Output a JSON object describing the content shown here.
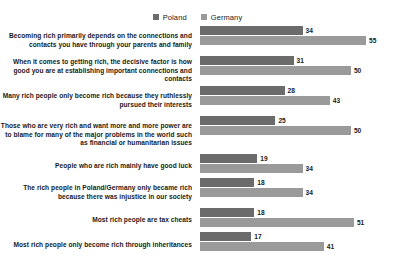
{
  "legend": {
    "items": [
      {
        "label": "Poland",
        "color": "#6b6b6b",
        "icon": "square-swatch-icon"
      },
      {
        "label": "Germany",
        "color": "#9a9a9a",
        "icon": "square-swatch-icon"
      }
    ]
  },
  "chart_data": {
    "type": "bar",
    "orientation": "horizontal",
    "title": "",
    "subtitle": "",
    "xlabel": "",
    "ylabel": "",
    "xlim": [
      0,
      55
    ],
    "grid": false,
    "legend_position": "top-center",
    "value_labels": true,
    "categories": [
      "Becoming rich primarily depends on the connections and contacts you have through your parents and family",
      "When it comes to getting rich, the decisive factor is how good you are at establishing important connections and contacts",
      "Many rich people only become rich because they ruthlessly pursued their interests",
      "Those who are very rich and want more and more power are to blame for many of the major problems in the world such as financial or humanitarian issues",
      "People who are rich mainly have good luck",
      "The rich people in Poland/Germany only became rich because there was injustice in our society",
      "Most rich people are tax cheats",
      "Most rich people only become rich through inheritances"
    ],
    "series": [
      {
        "name": "Poland",
        "color": "#6b6b6b",
        "values": [
          34,
          31,
          28,
          25,
          19,
          18,
          18,
          17
        ]
      },
      {
        "name": "Germany",
        "color": "#9a9a9a",
        "values": [
          55,
          50,
          43,
          50,
          34,
          34,
          51,
          41
        ]
      }
    ]
  }
}
